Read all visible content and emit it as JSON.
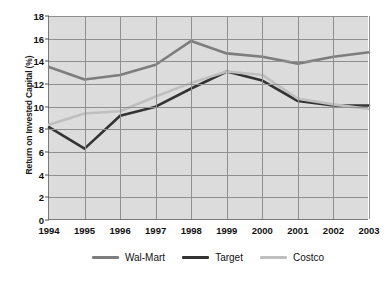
{
  "chart_data": {
    "type": "line",
    "title": "",
    "subtitle": "",
    "xlabel": "",
    "ylabel": "Return on Invested Capital (%)",
    "categories": [
      "1994",
      "1995",
      "1996",
      "1997",
      "1998",
      "1999",
      "2000",
      "2001",
      "2002",
      "2003"
    ],
    "x": [
      1994,
      1995,
      1996,
      1997,
      1998,
      1999,
      2000,
      2001,
      2002,
      2003
    ],
    "ylim": [
      0,
      18
    ],
    "yticks": [
      0,
      2,
      4,
      6,
      8,
      10,
      12,
      14,
      16,
      18
    ],
    "grid": true,
    "legend_position": "bottom",
    "series": [
      {
        "name": "Wal-Mart",
        "color": "#7d7d7d",
        "values": [
          13.5,
          12.4,
          12.8,
          13.7,
          15.8,
          14.7,
          14.4,
          13.8,
          14.4,
          14.8
        ]
      },
      {
        "name": "Target",
        "color": "#333333",
        "values": [
          8.2,
          6.3,
          9.2,
          10.0,
          11.6,
          13.1,
          12.3,
          10.5,
          10.1,
          10.1
        ]
      },
      {
        "name": "Costco",
        "color": "#bfbfbf",
        "values": [
          8.4,
          9.4,
          9.6,
          10.9,
          12.1,
          13.1,
          12.8,
          10.7,
          10.2,
          9.8
        ]
      }
    ]
  },
  "axes": {
    "y_tick_labels": [
      "18",
      "16",
      "14",
      "12",
      "10",
      "8",
      "6",
      "4",
      "2",
      "0"
    ],
    "x_tick_labels": [
      "1994",
      "1995",
      "1996",
      "1997",
      "1998",
      "1999",
      "2000",
      "2001",
      "2002",
      "2003"
    ],
    "y_axis_title": "Return on Invested Capital (%)"
  },
  "legend": {
    "items": [
      {
        "label": "Wal-Mart",
        "color": "#7d7d7d"
      },
      {
        "label": "Target",
        "color": "#333333"
      },
      {
        "label": "Costco",
        "color": "#bfbfbf"
      }
    ]
  },
  "style": {
    "plot_background": "#dcdcdc",
    "grid_color": "#8f8f8f",
    "page_background": "#ffffff",
    "text_color": "#111111"
  }
}
